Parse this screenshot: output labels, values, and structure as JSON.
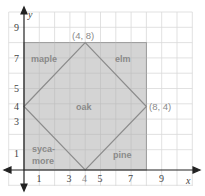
{
  "diagram": {
    "type": "coordinate-plane",
    "axes": {
      "x_label": "x",
      "y_label": "y",
      "x_ticks": [
        "1",
        "3",
        "4",
        "5",
        "7",
        "9"
      ],
      "y_ticks": [
        "1",
        "3",
        "4",
        "5",
        "7",
        "9"
      ]
    },
    "rectangle": {
      "x": [
        0,
        8
      ],
      "y": [
        0,
        8
      ],
      "fill": "#d4d4d4",
      "stroke": "#9a9a9a"
    },
    "diamond": {
      "vertices": [
        [
          0,
          4
        ],
        [
          4,
          8
        ],
        [
          8,
          4
        ],
        [
          4,
          0
        ]
      ],
      "stroke": "#8c8c8c"
    },
    "points": [
      {
        "label": "(4, 8)"
      },
      {
        "label": "(8, 4)"
      }
    ],
    "regions": {
      "maple": "maple",
      "elm": "elm",
      "oak": "oak",
      "sycamore_1": "syca-",
      "sycamore_2": "more",
      "pine": "pine"
    }
  }
}
